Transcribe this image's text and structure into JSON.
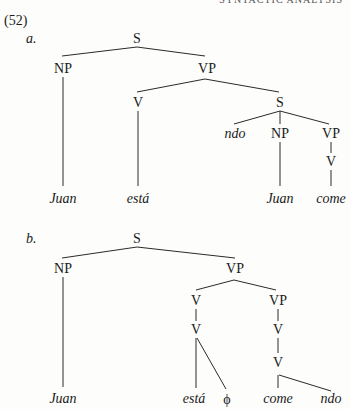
{
  "header": {
    "running_head": "SYNTACTIC ANALYSIS"
  },
  "example_number": "(52)",
  "trees": [
    {
      "label": "a.",
      "nodes": {
        "S": "S",
        "NP": "NP",
        "VP": "VP",
        "V": "V",
        "S2": "S",
        "ndo": "ndo",
        "NP2": "NP",
        "VP2": "VP",
        "V2": "V"
      },
      "leaves": {
        "juan": "Juan",
        "esta": "está",
        "juan2": "Juan",
        "come": "come"
      }
    },
    {
      "label": "b.",
      "nodes": {
        "S": "S",
        "NP": "NP",
        "VP": "VP",
        "V": "V",
        "V_inner": "V",
        "VP2": "VP",
        "V2": "V",
        "V3": "V"
      },
      "leaves": {
        "juan": "Juan",
        "esta": "está",
        "phi": "ϕ",
        "come": "come",
        "ndo": "ndo"
      }
    }
  ]
}
